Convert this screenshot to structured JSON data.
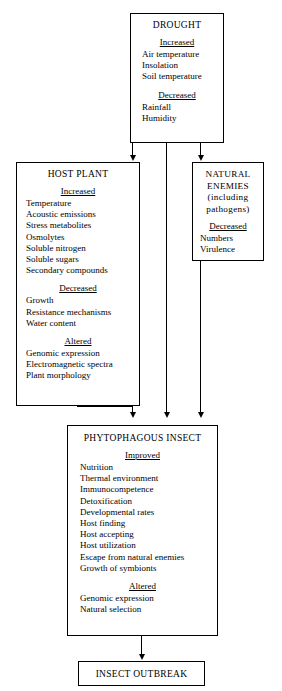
{
  "diagram": {
    "boxes": {
      "drought": {
        "title": "DROUGHT",
        "sections": [
          {
            "head": "Increased",
            "items": [
              "Air temperature",
              "Insolation",
              "Soil temperature"
            ]
          },
          {
            "head": "Decreased",
            "items": [
              "Rainfall",
              "Humidity"
            ]
          }
        ]
      },
      "host_plant": {
        "title": "HOST PLANT",
        "sections": [
          {
            "head": "Increased",
            "items": [
              "Temperature",
              "Acoustic emissions",
              "Stress metabolites",
              "Osmolytes",
              "Soluble nitrogen",
              "Soluble sugars",
              "Secondary compounds"
            ]
          },
          {
            "head": "Decreased",
            "items": [
              "Growth",
              "Resistance mechanisms",
              "Water content"
            ]
          },
          {
            "head": "Altered",
            "items": [
              "Genomic expression",
              "Electromagnetic spectra",
              "Plant morphology"
            ]
          }
        ]
      },
      "natural_enemies": {
        "title": "NATURAL ENEMIES (including pathogens)",
        "title_line1": "NATURAL",
        "title_line2": "ENEMIES",
        "title_line3": "(including",
        "title_line4": "pathogens)",
        "sections": [
          {
            "head": "Decreased",
            "items": [
              "Numbers",
              "Virulence"
            ]
          }
        ]
      },
      "phytophagous_insect": {
        "title": "PHYTOPHAGOUS INSECT",
        "sections": [
          {
            "head": "Improved",
            "items": [
              "Nutrition",
              "Thermal environment",
              "Immunocompetence",
              "Detoxification",
              "Developmental rates",
              "Host finding",
              "Host accepting",
              "Host utilization",
              "Escape from natural enemies",
              "Growth of symbionts"
            ]
          },
          {
            "head": "Altered",
            "items": [
              "Genomic expression",
              "Natural selection"
            ]
          }
        ]
      },
      "insect_outbreak": {
        "title": "INSECT OUTBREAK"
      }
    },
    "connectors": [
      {
        "name": "drought-to-host-plant",
        "from": "drought",
        "to": "host_plant"
      },
      {
        "name": "drought-to-natural-enemies",
        "from": "drought",
        "to": "natural_enemies"
      },
      {
        "name": "drought-to-phytophagous-insect",
        "from": "drought",
        "to": "phytophagous_insect"
      },
      {
        "name": "host-plant-to-phytophagous-insect",
        "from": "host_plant",
        "to": "phytophagous_insect"
      },
      {
        "name": "natural-enemies-to-phytophagous-insect",
        "from": "natural_enemies",
        "to": "phytophagous_insect"
      },
      {
        "name": "phytophagous-insect-to-insect-outbreak",
        "from": "phytophagous_insect",
        "to": "insect_outbreak"
      }
    ],
    "colors": {
      "background": "#ffffff",
      "stroke": "#000000",
      "text": "#000000"
    }
  }
}
